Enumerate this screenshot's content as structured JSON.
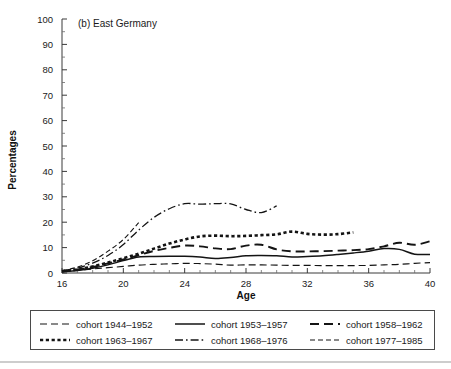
{
  "figure": {
    "panel_label": "(b) East Germany",
    "background_color": "#ffffff",
    "ink_color": "#141414"
  },
  "axes": {
    "y_title": "Percentages",
    "x_title": "Age"
  },
  "legend": {
    "entries": [
      {
        "label": "cohort 1944–1952",
        "style": "dashed-long"
      },
      {
        "label": "cohort 1953–1957",
        "style": "solid"
      },
      {
        "label": "cohort 1958–1962",
        "style": "dashed-heavy"
      },
      {
        "label": "cohort 1963–1967",
        "style": "dotted-thick"
      },
      {
        "label": "cohort 1968–1976",
        "style": "dash-dot"
      },
      {
        "label": "cohort 1977–1985",
        "style": "dashed-fine"
      }
    ]
  },
  "chart_data": {
    "type": "line",
    "title": "(b) East Germany",
    "xlabel": "Age",
    "ylabel": "Percentages",
    "xlim": [
      16,
      40
    ],
    "ylim": [
      0,
      100
    ],
    "x_ticks": [
      16,
      20,
      24,
      28,
      32,
      36,
      40
    ],
    "x_minor_step": 1,
    "y_ticks": [
      0,
      10,
      20,
      30,
      40,
      50,
      60,
      70,
      80,
      90,
      100
    ],
    "y_minor_step": 5,
    "grid": false,
    "legend_position": "below-plot",
    "series": [
      {
        "name": "cohort 1944–1952",
        "style": "dashed-long",
        "dash": "7,4",
        "width": 1.1,
        "x": [
          16,
          17,
          18,
          19,
          20,
          21,
          22,
          23,
          24,
          25,
          26,
          27,
          28,
          29,
          30,
          31,
          32,
          33,
          34,
          35,
          36,
          37,
          38,
          39,
          40
        ],
        "values": [
          0.6,
          1.0,
          1.6,
          2.1,
          2.6,
          3.1,
          3.4,
          3.6,
          3.8,
          3.7,
          3.5,
          3.1,
          3.2,
          3.2,
          3.1,
          3.0,
          3.0,
          2.9,
          2.9,
          2.9,
          3.0,
          3.2,
          3.4,
          3.8,
          4.1
        ]
      },
      {
        "name": "cohort 1953–1957",
        "style": "solid",
        "dash": "none",
        "width": 1.5,
        "x": [
          16,
          17,
          18,
          19,
          20,
          21,
          22,
          23,
          24,
          25,
          26,
          27,
          28,
          29,
          30,
          31,
          32,
          33,
          34,
          35,
          36,
          37,
          38,
          39,
          40
        ],
        "values": [
          0.5,
          1.0,
          1.9,
          3.2,
          4.9,
          6.3,
          6.5,
          6.6,
          6.6,
          6.3,
          5.7,
          6.1,
          6.8,
          6.9,
          6.8,
          6.3,
          6.5,
          6.8,
          7.3,
          7.9,
          8.6,
          9.6,
          9.3,
          7.4,
          7.3
        ]
      },
      {
        "name": "cohort 1958–1962",
        "style": "dashed-heavy",
        "dash": "9,5",
        "width": 1.9,
        "x": [
          16,
          17,
          18,
          19,
          20,
          21,
          22,
          23,
          24,
          25,
          26,
          27,
          28,
          29,
          30,
          31,
          32,
          33,
          34,
          35,
          36,
          37,
          38,
          39,
          40
        ],
        "values": [
          0.7,
          1.3,
          2.4,
          3.8,
          5.3,
          7.0,
          8.7,
          9.9,
          10.8,
          10.5,
          9.7,
          9.4,
          10.8,
          11.1,
          9.3,
          8.5,
          8.5,
          8.6,
          8.8,
          9.0,
          9.4,
          10.5,
          11.9,
          11.1,
          12.5
        ]
      },
      {
        "name": "cohort 1963–1967",
        "style": "dotted-thick",
        "dash": "3.2,2.6",
        "width": 2.6,
        "x": [
          16,
          17,
          18,
          19,
          20,
          21,
          22,
          23,
          24,
          25,
          26,
          27,
          28,
          29,
          30,
          31,
          32,
          33,
          34,
          35
        ],
        "values": [
          0.8,
          1.4,
          2.6,
          4.1,
          5.8,
          7.6,
          9.6,
          11.6,
          13.2,
          14.4,
          14.7,
          14.5,
          14.6,
          14.9,
          15.2,
          16.3,
          15.4,
          15.1,
          15.3,
          16.0
        ]
      },
      {
        "name": "cohort 1968–1976",
        "style": "dash-dot",
        "dash": "8,3,1.6,3",
        "width": 1.3,
        "x": [
          16,
          17,
          18,
          19,
          20,
          21,
          22,
          23,
          24,
          25,
          26,
          27,
          28,
          29,
          30
        ],
        "values": [
          0.8,
          1.9,
          3.9,
          6.9,
          11.2,
          16.9,
          21.9,
          25.3,
          27.3,
          27.1,
          27.3,
          27.2,
          25.0,
          23.8,
          26.4
        ]
      },
      {
        "name": "cohort 1977–1985",
        "style": "dashed-fine",
        "dash": "5,3",
        "width": 1.1,
        "x": [
          16,
          17,
          18,
          19,
          20,
          21
        ],
        "values": [
          0.9,
          2.3,
          4.8,
          8.6,
          13.2,
          19.8
        ]
      }
    ]
  }
}
